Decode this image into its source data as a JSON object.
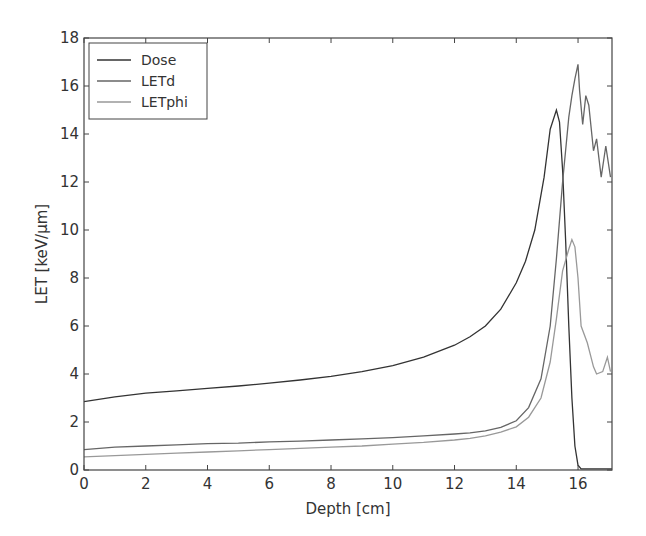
{
  "chart_data": {
    "type": "line",
    "title": "",
    "xlabel": "Depth [cm]",
    "ylabel": "LET [keV/μm]",
    "xlim": [
      0,
      17.1
    ],
    "ylim": [
      0,
      18
    ],
    "xticks": [
      0,
      2,
      4,
      6,
      8,
      10,
      12,
      14,
      16
    ],
    "yticks": [
      0,
      2,
      4,
      6,
      8,
      10,
      12,
      14,
      16,
      18
    ],
    "grid": false,
    "legend_position": "upper left",
    "series": [
      {
        "name": "Dose",
        "color": "#333333",
        "x": [
          0,
          1,
          2,
          3,
          4,
          5,
          6,
          7,
          8,
          9,
          10,
          11,
          12,
          12.5,
          13,
          13.5,
          14,
          14.3,
          14.6,
          14.9,
          15.1,
          15.3,
          15.4,
          15.5,
          15.6,
          15.7,
          15.8,
          15.9,
          16.0,
          16.1,
          16.5,
          17.1
        ],
        "y": [
          2.85,
          3.05,
          3.2,
          3.3,
          3.4,
          3.5,
          3.62,
          3.75,
          3.9,
          4.1,
          4.35,
          4.7,
          5.2,
          5.55,
          6.0,
          6.7,
          7.8,
          8.7,
          10.0,
          12.2,
          14.2,
          15.0,
          14.5,
          12.5,
          9.5,
          6.0,
          3.0,
          1.0,
          0.2,
          0.05,
          0.05,
          0.05
        ]
      },
      {
        "name": "LETd",
        "color": "#666666",
        "x": [
          0,
          1,
          2,
          3,
          4,
          5,
          6,
          7,
          8,
          9,
          10,
          11,
          12,
          12.5,
          13,
          13.5,
          14,
          14.4,
          14.8,
          15.1,
          15.3,
          15.5,
          15.7,
          15.8,
          15.9,
          16.0,
          16.05,
          16.15,
          16.25,
          16.35,
          16.5,
          16.6,
          16.75,
          16.9,
          17.05
        ],
        "y": [
          0.85,
          0.95,
          1.0,
          1.05,
          1.1,
          1.12,
          1.17,
          1.2,
          1.25,
          1.3,
          1.35,
          1.42,
          1.5,
          1.55,
          1.63,
          1.78,
          2.05,
          2.6,
          3.8,
          6.0,
          8.8,
          12.0,
          14.7,
          15.6,
          16.3,
          16.9,
          15.8,
          14.4,
          15.6,
          15.2,
          13.3,
          13.8,
          12.2,
          13.5,
          12.2
        ]
      },
      {
        "name": "LETphi",
        "color": "#999999",
        "x": [
          0,
          1,
          2,
          3,
          4,
          5,
          6,
          7,
          8,
          9,
          10,
          11,
          12,
          12.5,
          13,
          13.5,
          14,
          14.4,
          14.8,
          15.1,
          15.3,
          15.5,
          15.7,
          15.8,
          15.9,
          16.0,
          16.1,
          16.3,
          16.5,
          16.6,
          16.8,
          16.95,
          17.05
        ],
        "y": [
          0.55,
          0.6,
          0.65,
          0.7,
          0.75,
          0.8,
          0.85,
          0.9,
          0.95,
          1.0,
          1.08,
          1.15,
          1.25,
          1.32,
          1.42,
          1.58,
          1.8,
          2.2,
          3.0,
          4.5,
          6.3,
          8.3,
          9.2,
          9.6,
          9.3,
          8.0,
          6.0,
          5.3,
          4.3,
          4.0,
          4.1,
          4.7,
          4.1
        ]
      }
    ]
  }
}
